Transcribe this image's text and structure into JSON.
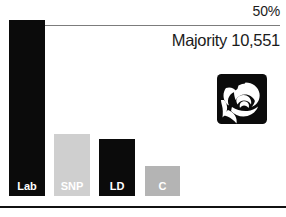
{
  "chart_data": {
    "type": "bar",
    "title": "",
    "subtitle": "",
    "xlabel": "",
    "ylabel": "",
    "ylim": [
      0,
      57
    ],
    "grid": false,
    "legend": "none",
    "categories": [
      "Lab",
      "SNP",
      "LD",
      "C"
    ],
    "values": [
      50.9,
      17.9,
      16.4,
      8.8
    ],
    "colors": [
      "#0b0b0b",
      "#cfcfcf",
      "#0b0b0b",
      "#b4b4b4"
    ],
    "label_colors": [
      "#ffffff",
      "#ffffff",
      "#ffffff",
      "#ffffff"
    ],
    "annotations": [
      {
        "name": "threshold",
        "text": "50%",
        "value": 50
      },
      {
        "name": "majority",
        "text": "Majority 10,551"
      }
    ]
  },
  "threshold": {
    "label": "50%"
  },
  "majority": {
    "label": "Majority 10,551"
  },
  "bars": [
    {
      "label": "Lab",
      "value": 50.9
    },
    {
      "label": "SNP",
      "value": 17.9
    },
    {
      "label": "LD",
      "value": 16.4
    },
    {
      "label": "C",
      "value": 8.8
    }
  ],
  "logo": {
    "name": "labour-rose-logo",
    "alt": "Labour Party rose"
  },
  "colors": {
    "bar_dark": "#0b0b0b",
    "bar_light": "#cfcfcf",
    "bar_mid": "#b4b4b4",
    "threshold_line": "#7c7c7c",
    "rule": "#111111",
    "text": "#1b1b1b",
    "bar_label_text": "#ffffff"
  }
}
